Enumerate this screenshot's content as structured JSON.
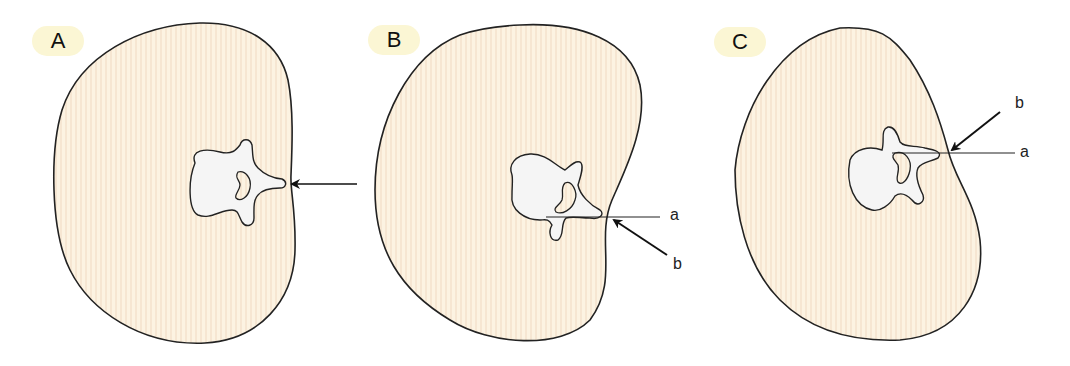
{
  "figure": {
    "panels": [
      {
        "id": "A",
        "label": "A",
        "line_labels": []
      },
      {
        "id": "B",
        "label": "B",
        "line_labels": [
          "a",
          "b"
        ]
      },
      {
        "id": "C",
        "label": "C",
        "line_labels": [
          "b",
          "a"
        ]
      }
    ]
  },
  "colors": {
    "body_fill": "#fcf3e2",
    "stripe": "#f6e6d2",
    "vertebra_fill": "#f5f5f5",
    "outline": "#222222",
    "badge": "#fbf6d4"
  }
}
